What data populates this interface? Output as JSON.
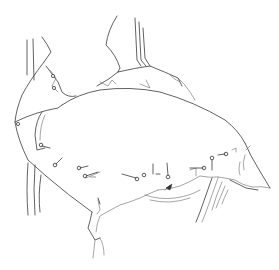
{
  "image": {
    "subject": "line-drawing-of-chair-draped-with-pinned-fabric",
    "background": "#ffffff",
    "line_color": "#3a3a3a"
  },
  "pins": [
    {
      "x": 41,
      "y": 145
    },
    {
      "x": 55,
      "y": 165
    },
    {
      "x": 79,
      "y": 168
    },
    {
      "x": 85,
      "y": 176
    },
    {
      "x": 92,
      "y": 177
    },
    {
      "x": 137,
      "y": 179
    },
    {
      "x": 144,
      "y": 175
    },
    {
      "x": 168,
      "y": 177
    },
    {
      "x": 204,
      "y": 168
    },
    {
      "x": 212,
      "y": 160
    },
    {
      "x": 226,
      "y": 154
    },
    {
      "x": 18,
      "y": 124
    },
    {
      "x": 53,
      "y": 76
    },
    {
      "x": 54,
      "y": 88
    }
  ]
}
